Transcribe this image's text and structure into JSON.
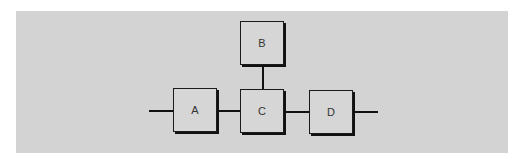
{
  "diagram": {
    "type": "block-diagram",
    "nodes": [
      {
        "id": "A",
        "label": "A"
      },
      {
        "id": "B",
        "label": "B"
      },
      {
        "id": "C",
        "label": "C"
      },
      {
        "id": "D",
        "label": "D"
      }
    ],
    "edges": [
      {
        "from": "input",
        "to": "A"
      },
      {
        "from": "A",
        "to": "C"
      },
      {
        "from": "B",
        "to": "C"
      },
      {
        "from": "C",
        "to": "D"
      },
      {
        "from": "D",
        "to": "output"
      }
    ],
    "colors": {
      "panel": "#d3d3d3",
      "box": "#d6d6d6",
      "line": "#111111"
    }
  }
}
